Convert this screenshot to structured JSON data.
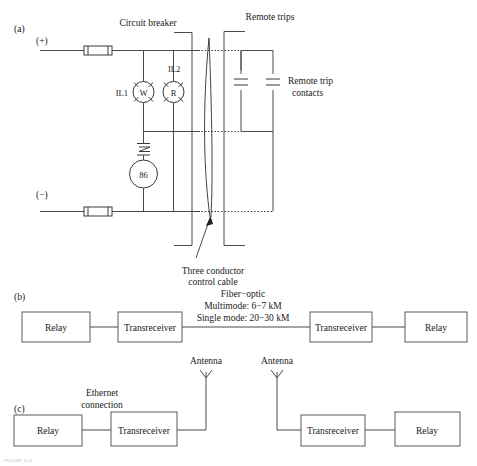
{
  "figure": {
    "panels": [
      {
        "id": "a",
        "label": "(a)"
      },
      {
        "id": "b",
        "label": "(b)"
      },
      {
        "id": "c",
        "label": "(c)"
      }
    ]
  },
  "panel_a": {
    "label": "(a)",
    "labels": {
      "circuit_breaker": "Circuit breaker",
      "remote_trips": "Remote trips",
      "remote_trip_contacts_line1": "Remote trip",
      "remote_trip_contacts_line2": "contacts",
      "positive_rail": "(+)",
      "negative_rail": "(−)",
      "cable_line1": "Three conductor",
      "cable_line2": "control cable"
    },
    "devices": {
      "lamp_white_tag": "IL1",
      "lamp_white_letter": "W",
      "lamp_red_tag": "IL2",
      "lamp_red_letter": "R",
      "lockout_relay": "86"
    }
  },
  "panel_b": {
    "label": "(b)",
    "link_notes": {
      "line1": "Fiber−optic",
      "line2": "Multimode: 6−7 kM",
      "line3": "Single mode: 20−30 kM"
    },
    "blocks": [
      {
        "name": "relay-left",
        "label": "Relay"
      },
      {
        "name": "transreceiver-left",
        "label": "Transreceiver"
      },
      {
        "name": "transreceiver-right",
        "label": "Transreceiver"
      },
      {
        "name": "relay-right",
        "label": "Relay"
      }
    ]
  },
  "panel_c": {
    "label": "(c)",
    "labels": {
      "ethernet_line1": "Ethernet",
      "ethernet_line2": "connection",
      "antenna_left": "Antenna",
      "antenna_right": "Antenna"
    },
    "blocks": [
      {
        "name": "relay-left",
        "label": "Relay"
      },
      {
        "name": "transreceiver-left",
        "label": "Transreceiver"
      },
      {
        "name": "transreceiver-right",
        "label": "Transreceiver"
      },
      {
        "name": "relay-right",
        "label": "Relay"
      }
    ]
  },
  "caption": {
    "text": "FIGURE 11.6"
  },
  "colors": {
    "background": "#ffffff",
    "line": "#4a4a4a",
    "text": "#1a1a1a",
    "symbol": "#3a3a3a"
  }
}
